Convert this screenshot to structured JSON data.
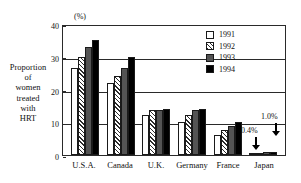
{
  "chart_data": {
    "type": "bar",
    "title": "",
    "unit_label": "(%)",
    "ylabel": "Proportion of women treated with HRT",
    "ylabel_lines": [
      "Proportion",
      "of",
      "women",
      "treated",
      "with",
      "HRT"
    ],
    "xlabel": "",
    "ylim": [
      0,
      40
    ],
    "yticks": [
      0,
      10,
      20,
      30,
      40
    ],
    "ytick_labels": [
      "0",
      "10",
      "20",
      "30",
      "40"
    ],
    "grid": true,
    "legend_position": "top-right",
    "categories": [
      "U.S.A.",
      "Canada",
      "U.K.",
      "Germany",
      "France",
      "Japan"
    ],
    "series": [
      {
        "name": "1991",
        "color": "#ffffff",
        "values": [
          26.5,
          22.0,
          12.3,
          10.2,
          6.0,
          0.3
        ]
      },
      {
        "name": "1992",
        "color": "#ffffff",
        "values": [
          30.0,
          24.0,
          13.8,
          12.2,
          7.5,
          0.4
        ]
      },
      {
        "name": "1993",
        "color": "#545454",
        "values": [
          33.0,
          26.5,
          13.7,
          13.6,
          9.0,
          0.8
        ]
      },
      {
        "name": "1994",
        "color": "#000000",
        "values": [
          35.2,
          30.0,
          14.0,
          14.0,
          10.0,
          1.0
        ]
      }
    ],
    "annotations": [
      {
        "text": "0.4%",
        "target": "Japan 1992"
      },
      {
        "text": "1.0%",
        "target": "Japan 1994"
      }
    ]
  }
}
